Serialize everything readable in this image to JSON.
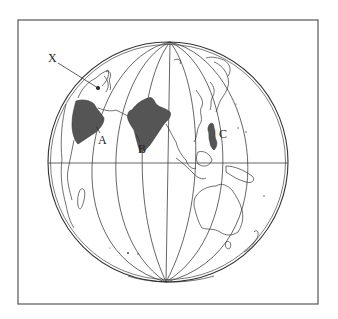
{
  "figure": {
    "type": "orthographic-globe-map",
    "frame": {
      "x": 18,
      "y": 20,
      "width": 300,
      "height": 284
    },
    "globe": {
      "cx": 168,
      "cy": 162,
      "r": 120
    },
    "colors": {
      "shaded_region": "#555555",
      "lines": "#333333",
      "background": "#ffffff"
    }
  },
  "labels": {
    "x": {
      "text": "X",
      "x": 48,
      "y": 62
    },
    "a": {
      "text": "A",
      "x": 98,
      "y": 139
    },
    "b": {
      "text": "B",
      "x": 138,
      "y": 149
    },
    "c": {
      "text": "C",
      "x": 221,
      "y": 134
    }
  },
  "shaded_regions": [
    {
      "id": "A",
      "name": "Arabian Peninsula"
    },
    {
      "id": "B",
      "name": "Indian subcontinent"
    },
    {
      "id": "C",
      "name": "Philippines"
    }
  ],
  "marker_x": {
    "name": "point X",
    "x": 98,
    "y": 88
  }
}
